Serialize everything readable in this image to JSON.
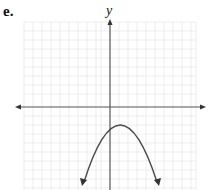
{
  "problem_label": "e.",
  "axis": {
    "y_label": "y",
    "x_label": ""
  },
  "graph": {
    "type": "parabola",
    "orientation": "opens-downward",
    "description": "Downward-opening parabola with vertex slightly right of the y-axis, above the x-axis; arrows on both ends pointing down",
    "colors": {
      "curve": "#4a4a4a",
      "axes": "#555555",
      "grid": "#e6e6e6"
    }
  }
}
